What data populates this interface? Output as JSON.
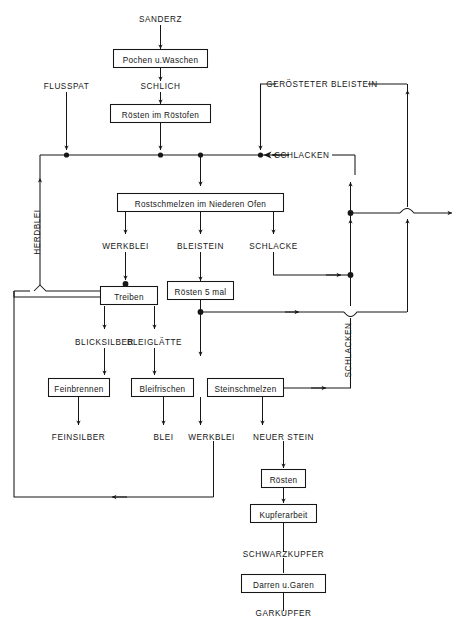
{
  "diagram": {
    "language": "de",
    "line_color": "#161616",
    "background_color": "#ffffff",
    "process_boxes": [
      {
        "id": "pochen",
        "label": "Pochen u.Waschen"
      },
      {
        "id": "roesten_ofen",
        "label": "Rösten im Röstofen"
      },
      {
        "id": "rostschmelzen",
        "label": "Rostschmelzen im Niederen Ofen"
      },
      {
        "id": "treiben",
        "label": "Treiben"
      },
      {
        "id": "roesten5",
        "label": "Rösten 5 mal"
      },
      {
        "id": "feinbrennen",
        "label": "Feinbrennen"
      },
      {
        "id": "bleifrischen",
        "label": "Bleifrischen"
      },
      {
        "id": "steinschmelzen",
        "label": "Steinschmelzen"
      },
      {
        "id": "roesten",
        "label": "Rösten"
      },
      {
        "id": "kupferarbeit",
        "label": "Kupferarbeit"
      },
      {
        "id": "darren",
        "label": "Darren u.Garen"
      }
    ],
    "material_labels": [
      {
        "id": "sanderz",
        "label": "SANDERZ"
      },
      {
        "id": "schlich",
        "label": "SCHLICH"
      },
      {
        "id": "flusspat",
        "label": "FLUSSPAT"
      },
      {
        "id": "geroesteter_bleistein",
        "label": "GERÖSTETER BLEISTEIN"
      },
      {
        "id": "schlacken_top",
        "label": "SCHLACKEN"
      },
      {
        "id": "herdblei",
        "label": "HERDBLEI"
      },
      {
        "id": "werkblei_top",
        "label": "WERKBLEI"
      },
      {
        "id": "bleistein",
        "label": "BLEISTEIN"
      },
      {
        "id": "schlacke",
        "label": "SCHLACKE"
      },
      {
        "id": "blicksilber",
        "label": "BLICKSILBER"
      },
      {
        "id": "bleiglaette",
        "label": "BLEIGLÄTTE"
      },
      {
        "id": "schlacken_right",
        "label": "SCHLACKEN"
      },
      {
        "id": "feinsilber",
        "label": "FEINSILBER"
      },
      {
        "id": "blei",
        "label": "BLEI"
      },
      {
        "id": "werkblei_bottom",
        "label": "WERKBLEI"
      },
      {
        "id": "neuer_stein",
        "label": "NEUER STEIN"
      },
      {
        "id": "schwarzkupfer",
        "label": "SCHWARZKUPFER"
      },
      {
        "id": "garkupfer",
        "label": "GARKUPFER"
      }
    ]
  }
}
